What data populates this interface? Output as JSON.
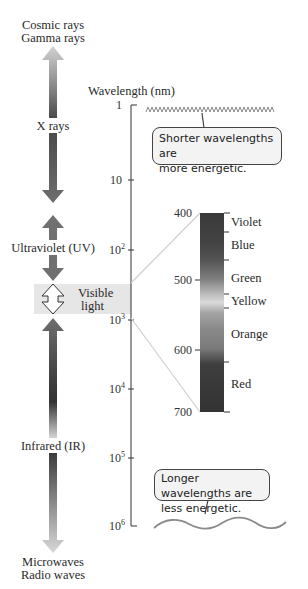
{
  "figure": {
    "type": "electromagnetic-spectrum-diagram",
    "axis_title": "Wavelength (nm)",
    "axis_ticks": [
      {
        "label_base": "1",
        "label_exp": "",
        "y": 105
      },
      {
        "label_base": "10",
        "label_exp": "",
        "y": 180
      },
      {
        "label_base": "10",
        "label_exp": "2",
        "y": 250
      },
      {
        "label_base": "10",
        "label_exp": "3",
        "y": 320
      },
      {
        "label_base": "10",
        "label_exp": "4",
        "y": 389
      },
      {
        "label_base": "10",
        "label_exp": "5",
        "y": 458
      },
      {
        "label_base": "10",
        "label_exp": "6",
        "y": 526
      }
    ],
    "regions": {
      "top_label_line1": "Cosmic rays",
      "top_label_line2": "Gamma rays",
      "xrays": "X rays",
      "ultraviolet": "Ultraviolet (UV)",
      "visible_line1": "Visible",
      "visible_line2": "light",
      "infrared": "Infrared (IR)",
      "bottom_label_line1": "Microwaves",
      "bottom_label_line2": "Radio waves"
    },
    "visible_spectrum": {
      "ticks": [
        {
          "label": "400",
          "y": 213
        },
        {
          "label": "500",
          "y": 280
        },
        {
          "label": "600",
          "y": 350
        },
        {
          "label": "700",
          "y": 412
        }
      ],
      "colors": [
        {
          "name": "Violet",
          "y": 219
        },
        {
          "name": "Blue",
          "y": 242
        },
        {
          "name": "Green",
          "y": 275
        },
        {
          "name": "Yellow",
          "y": 298
        },
        {
          "name": "Orange",
          "y": 331
        },
        {
          "name": "Red",
          "y": 381
        }
      ]
    },
    "callouts": {
      "short": "Shorter wavelengths are more energetic.",
      "short_line1": "Shorter wavelengths are",
      "short_line2": "more energetic.",
      "long": "Longer wavelengths are less energetic.",
      "long_line1": "Longer wavelengths are",
      "long_line2": "less energetic."
    },
    "colors": {
      "arrow_dark": "#4a4a4a",
      "arrow_mid": "#7a7a7a",
      "arrow_light": "#c8c8c8",
      "visible_band": "#e6e6e6",
      "wave": "#8a8a8a",
      "axis": "#333333",
      "guide_lines": "#c9c9c9"
    }
  }
}
